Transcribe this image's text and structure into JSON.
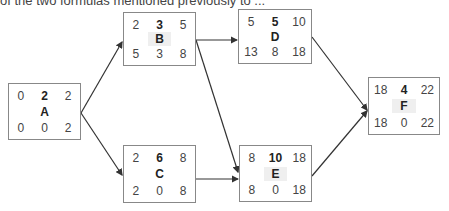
{
  "caption": "of the two formulas mentioned previously to ...",
  "nodes": {
    "A": {
      "name": "A",
      "es": "0",
      "dur": "2",
      "ef": "2",
      "ls": "0",
      "slack": "0",
      "lf": "2"
    },
    "B": {
      "name": "B",
      "es": "2",
      "dur": "3",
      "ef": "5",
      "ls": "5",
      "slack": "3",
      "lf": "8"
    },
    "C": {
      "name": "C",
      "es": "2",
      "dur": "6",
      "ef": "8",
      "ls": "2",
      "slack": "0",
      "lf": "8"
    },
    "D": {
      "name": "D",
      "es": "5",
      "dur": "5",
      "ef": "10",
      "ls": "13",
      "slack": "8",
      "lf": "18"
    },
    "E": {
      "name": "E",
      "es": "8",
      "dur": "10",
      "ef": "18",
      "ls": "8",
      "slack": "0",
      "lf": "18"
    },
    "F": {
      "name": "F",
      "es": "18",
      "dur": "4",
      "ef": "22",
      "ls": "18",
      "slack": "0",
      "lf": "22"
    }
  },
  "edges": [
    {
      "from": "A",
      "to": "B"
    },
    {
      "from": "A",
      "to": "C"
    },
    {
      "from": "B",
      "to": "D"
    },
    {
      "from": "B",
      "to": "E"
    },
    {
      "from": "C",
      "to": "E"
    },
    {
      "from": "D",
      "to": "F"
    },
    {
      "from": "E",
      "to": "F"
    }
  ],
  "colors": {
    "line": "#333333",
    "border": "#888888",
    "shade": "#efefef"
  }
}
